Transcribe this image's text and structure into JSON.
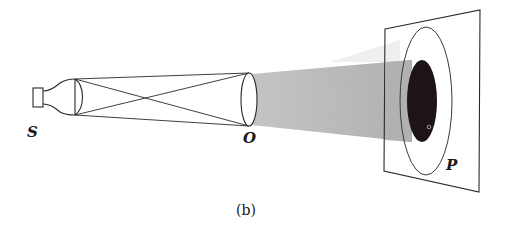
{
  "figure": {
    "caption": "(b)",
    "labels": {
      "source": "S",
      "objective": "O",
      "screen": "P"
    },
    "colors": {
      "line": "#2a2a2a",
      "beam": "#b5b5b5",
      "spot": "#1c1416",
      "background": "#ffffff"
    }
  }
}
